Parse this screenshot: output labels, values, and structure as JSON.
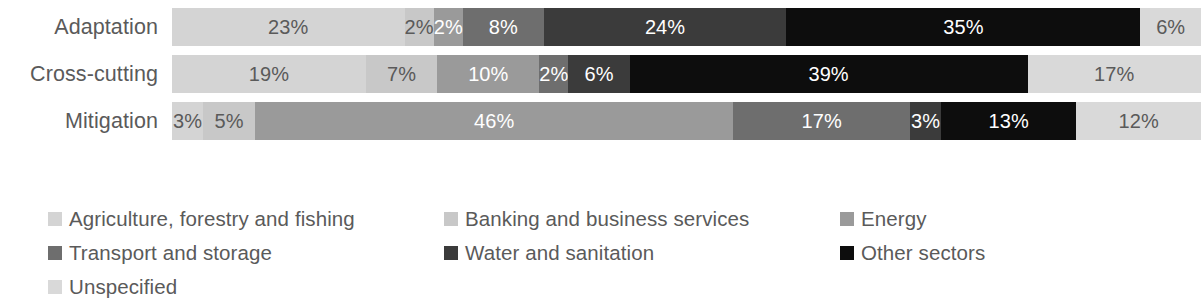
{
  "chart_data": {
    "type": "bar",
    "orientation": "horizontal",
    "stacked": true,
    "normalized": true,
    "title": "",
    "subtitle": "",
    "xlabel": "",
    "ylabel": "",
    "xlim": [
      0,
      100
    ],
    "grid": false,
    "legend_position": "bottom",
    "value_suffix": "%",
    "categories": [
      "Adaptation",
      "Cross-cutting",
      "Mitigation"
    ],
    "series": [
      {
        "name": "Agriculture, forestry and fishing",
        "color": "#d4d4d4",
        "text_color": "#5a5a5a",
        "values": [
          23,
          19,
          3
        ],
        "labels": [
          "23%",
          "19%",
          "3%"
        ]
      },
      {
        "name": "Banking and business services",
        "color": "#c8c8c8",
        "text_color": "#5a5a5a",
        "values": [
          2,
          7,
          5
        ],
        "labels": [
          "2%",
          "7%",
          "5%"
        ]
      },
      {
        "name": "Energy",
        "color": "#9a9a9a",
        "text_color": "#ffffff",
        "values": [
          2,
          10,
          46
        ],
        "labels": [
          "2%",
          "10%",
          "46%"
        ]
      },
      {
        "name": "Transport and storage",
        "color": "#6e6e6e",
        "text_color": "#ffffff",
        "values": [
          8,
          2,
          17
        ],
        "labels": [
          "8%",
          "2%",
          "17%"
        ]
      },
      {
        "name": "Water and sanitation",
        "color": "#3b3b3b",
        "text_color": "#ffffff",
        "values": [
          24,
          6,
          3
        ],
        "labels": [
          "24%",
          "6%",
          "3%"
        ]
      },
      {
        "name": "Other sectors",
        "color": "#0d0d0d",
        "text_color": "#ffffff",
        "values": [
          35,
          39,
          13
        ],
        "labels": [
          "35%",
          "39%",
          "13%"
        ]
      },
      {
        "name": "Unspecified",
        "color": "#d9d9d9",
        "text_color": "#5a5a5a",
        "values": [
          6,
          17,
          12
        ],
        "labels": [
          "6%",
          "17%",
          "12%"
        ]
      }
    ]
  },
  "axis": {
    "category_labels": [
      {
        "text": "Adaptation"
      },
      {
        "text": "Cross-cutting"
      },
      {
        "text": "Mitigation"
      }
    ]
  },
  "bars": [
    {
      "category": "Adaptation",
      "segments": [
        {
          "series": "Agriculture, forestry and fishing",
          "label": "23%",
          "value": 23,
          "color": "#d4d4d4",
          "tone": "light"
        },
        {
          "series": "Banking and business services",
          "label": "2%",
          "value": 2,
          "color": "#c8c8c8",
          "tone": "light"
        },
        {
          "series": "Energy",
          "label": "2%",
          "value": 2,
          "color": "#9a9a9a",
          "tone": "dark"
        },
        {
          "series": "Transport and storage",
          "label": "8%",
          "value": 8,
          "color": "#6e6e6e",
          "tone": "dark"
        },
        {
          "series": "Water and sanitation",
          "label": "24%",
          "value": 24,
          "color": "#3b3b3b",
          "tone": "dark"
        },
        {
          "series": "Other sectors",
          "label": "35%",
          "value": 35,
          "color": "#0d0d0d",
          "tone": "dark"
        },
        {
          "series": "Unspecified",
          "label": "6%",
          "value": 6,
          "color": "#d9d9d9",
          "tone": "light"
        }
      ]
    },
    {
      "category": "Cross-cutting",
      "segments": [
        {
          "series": "Agriculture, forestry and fishing",
          "label": "19%",
          "value": 19,
          "color": "#d4d4d4",
          "tone": "light"
        },
        {
          "series": "Banking and business services",
          "label": "7%",
          "value": 7,
          "color": "#c8c8c8",
          "tone": "light"
        },
        {
          "series": "Energy",
          "label": "10%",
          "value": 10,
          "color": "#9a9a9a",
          "tone": "dark"
        },
        {
          "series": "Transport and storage",
          "label": "2%",
          "value": 2,
          "color": "#6e6e6e",
          "tone": "dark"
        },
        {
          "series": "Water and sanitation",
          "label": "6%",
          "value": 6,
          "color": "#3b3b3b",
          "tone": "dark"
        },
        {
          "series": "Other sectors",
          "label": "39%",
          "value": 39,
          "color": "#0d0d0d",
          "tone": "dark"
        },
        {
          "series": "Unspecified",
          "label": "17%",
          "value": 17,
          "color": "#d9d9d9",
          "tone": "light"
        }
      ]
    },
    {
      "category": "Mitigation",
      "segments": [
        {
          "series": "Agriculture, forestry and fishing",
          "label": "3%",
          "value": 3,
          "color": "#d4d4d4",
          "tone": "light"
        },
        {
          "series": "Banking and business services",
          "label": "5%",
          "value": 5,
          "color": "#c8c8c8",
          "tone": "light"
        },
        {
          "series": "Energy",
          "label": "46%",
          "value": 46,
          "color": "#9a9a9a",
          "tone": "dark"
        },
        {
          "series": "Transport and storage",
          "label": "17%",
          "value": 17,
          "color": "#6e6e6e",
          "tone": "dark"
        },
        {
          "series": "Water and sanitation",
          "label": "3%",
          "value": 3,
          "color": "#3b3b3b",
          "tone": "dark"
        },
        {
          "series": "Other sectors",
          "label": "13%",
          "value": 13,
          "color": "#0d0d0d",
          "tone": "dark"
        },
        {
          "series": "Unspecified",
          "label": "12%",
          "value": 12,
          "color": "#d9d9d9",
          "tone": "light"
        }
      ]
    }
  ],
  "legend": {
    "items": [
      {
        "label": "Agriculture, forestry and fishing",
        "color": "#d4d4d4",
        "swatch": "legend-swatch-icon"
      },
      {
        "label": "Banking and business services",
        "color": "#c8c8c8",
        "swatch": "legend-swatch-icon"
      },
      {
        "label": "Energy",
        "color": "#9a9a9a",
        "swatch": "legend-swatch-icon"
      },
      {
        "label": "Transport and storage",
        "color": "#6e6e6e",
        "swatch": "legend-swatch-icon"
      },
      {
        "label": "Water and sanitation",
        "color": "#3b3b3b",
        "swatch": "legend-swatch-icon"
      },
      {
        "label": "Other sectors",
        "color": "#0d0d0d",
        "swatch": "legend-swatch-icon"
      },
      {
        "label": "Unspecified",
        "color": "#d9d9d9",
        "swatch": "legend-swatch-icon"
      }
    ]
  }
}
